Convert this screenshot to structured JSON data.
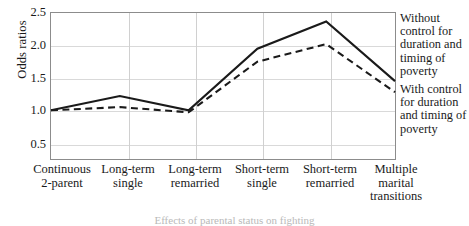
{
  "chart_data": {
    "type": "line",
    "title": "",
    "xlabel": "",
    "ylabel": "Odds ratios",
    "ylim": [
      0.25,
      2.5
    ],
    "yticks": [
      "2.5",
      "2.0",
      "1.5",
      "1.0",
      "0.5"
    ],
    "ytick_values": [
      2.5,
      2.0,
      1.5,
      1.0,
      0.5
    ],
    "grid": true,
    "legend_position": "right",
    "categories": [
      "Continuous 2-parent",
      "Long-term single",
      "Long-term remarried",
      "Short-term single",
      "Short-term remarried",
      "Multiple marital transitions"
    ],
    "category_lines": [
      [
        "Continuous",
        "2-parent"
      ],
      [
        "Long-term",
        "single"
      ],
      [
        "Long-term",
        "remarried"
      ],
      [
        "Short-term",
        "single"
      ],
      [
        "Short-term",
        "remarried"
      ],
      [
        "Multiple",
        "marital",
        "transitions"
      ]
    ],
    "series": [
      {
        "name": "Without control for duration and timing of poverty",
        "style": "solid",
        "color": "#1a1a1a",
        "values": [
          1.0,
          1.22,
          1.0,
          1.95,
          2.37,
          1.45
        ]
      },
      {
        "name": "With control for duration and timing of poverty",
        "style": "dashed",
        "color": "#1a1a1a",
        "values": [
          1.0,
          1.05,
          0.97,
          1.75,
          2.02,
          1.28
        ]
      }
    ],
    "axis_color": "#8c8c8c",
    "grid_color": "#d9d9d9"
  },
  "legend": {
    "entries": [
      "Without control for duration and timing of poverty",
      "With control for duration and timing of poverty"
    ]
  },
  "caption": "Effects of parental status on fighting"
}
